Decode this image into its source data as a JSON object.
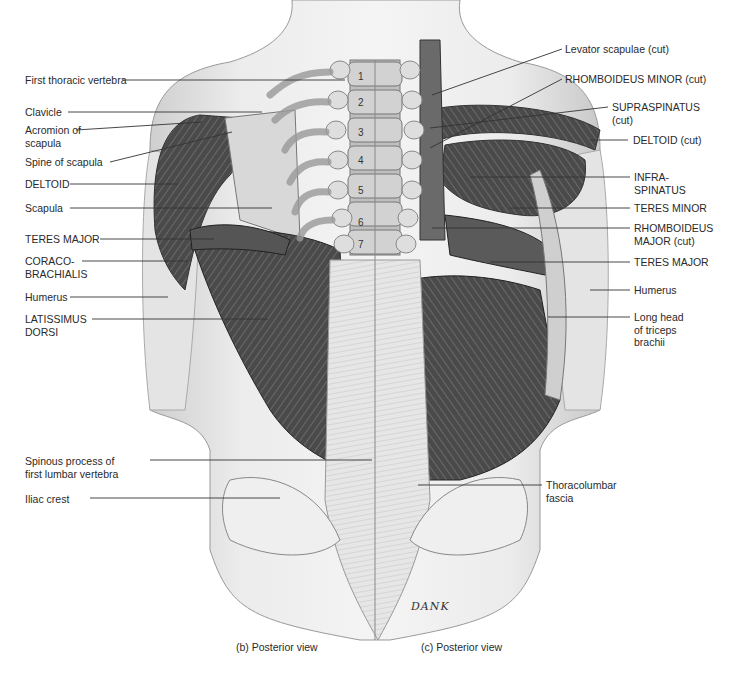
{
  "figure": {
    "left_labels": [
      {
        "id": "first-thoracic-vertebra",
        "text": "First thoracic vertebra",
        "x": 25,
        "y": 75,
        "lx": [
          122,
          330
        ],
        "ly": 80
      },
      {
        "id": "clavicle",
        "text": "Clavicle",
        "x": 25,
        "y": 107,
        "lx": [
          68,
          260
        ],
        "ly": 112
      },
      {
        "id": "acromion-of-scapula",
        "text": "Acromion of\nscapula",
        "x": 25,
        "y": 125,
        "lx": [
          76,
          200
        ],
        "ly": 130
      },
      {
        "id": "spine-of-scapula",
        "text": "Spine of scapula",
        "x": 25,
        "y": 157,
        "lx": [
          110,
          230
        ],
        "ly": 162
      },
      {
        "id": "deltoid",
        "text": "DELTOID",
        "x": 25,
        "y": 179,
        "lx": [
          70,
          178
        ],
        "ly": 184
      },
      {
        "id": "scapula",
        "text": "Scapula",
        "x": 25,
        "y": 203,
        "lx": [
          70,
          272
        ],
        "ly": 208
      },
      {
        "id": "teres-major-left",
        "text": "TERES MAJOR",
        "x": 25,
        "y": 234,
        "lx": [
          100,
          212
        ],
        "ly": 239
      },
      {
        "id": "coraco-brachialis",
        "text": "CORACO-\nBRACHIALIS",
        "x": 25,
        "y": 256,
        "lx": [
          82,
          186
        ],
        "ly": 261
      },
      {
        "id": "humerus-left",
        "text": "Humerus",
        "x": 25,
        "y": 292,
        "lx": [
          70,
          168
        ],
        "ly": 297
      },
      {
        "id": "latissimus-dorsi",
        "text": "LATISSIMUS\nDORSI",
        "x": 25,
        "y": 314,
        "lx": [
          92,
          268
        ],
        "ly": 319
      }
    ],
    "right_labels": [
      {
        "id": "levator-scapulae-cut",
        "text": "Levator scapulae (cut)",
        "x": 565,
        "y": 44
      },
      {
        "id": "rhomboideus-minor-cut",
        "text": "RHOMBOIDEUS MINOR (cut)",
        "x": 565,
        "y": 74
      },
      {
        "id": "supraspinatus-cut",
        "text": "SUPRASPINATUS\n(cut)",
        "x": 612,
        "y": 102
      },
      {
        "id": "deltoid-cut",
        "text": "DELTOID (cut)",
        "x": 632,
        "y": 135
      },
      {
        "id": "infraspinatus",
        "text": "INFRA-\nSPINATUS",
        "x": 634,
        "y": 172
      },
      {
        "id": "teres-minor",
        "text": "TERES MINOR",
        "x": 634,
        "y": 203
      },
      {
        "id": "rhomboideus-major-cut",
        "text": "RHOMBOIDEUS\nMAJOR (cut)",
        "x": 634,
        "y": 222
      },
      {
        "id": "teres-major-right",
        "text": "TERES MAJOR",
        "x": 634,
        "y": 257
      },
      {
        "id": "humerus-right",
        "text": "Humerus",
        "x": 634,
        "y": 285
      },
      {
        "id": "long-head-triceps",
        "text": "Long head\nof triceps\nbrachii",
        "x": 634,
        "y": 312
      }
    ],
    "lower_labels": [
      {
        "id": "spinous-process-l1",
        "text": "Spinous process of\nfirst lumbar vertebra",
        "x": 25,
        "y": 456
      },
      {
        "id": "iliac-crest",
        "text": "Iliac crest",
        "x": 25,
        "y": 494
      },
      {
        "id": "thoracolumbar-fascia",
        "text": "Thoracolumbar\nfascia",
        "x": 546,
        "y": 480
      }
    ],
    "vertebra_numbers": [
      "1",
      "2",
      "3",
      "4",
      "5",
      "6",
      "7"
    ],
    "signature": "DANK",
    "captions": {
      "left": "(b) Posterior view",
      "right": "(c) Posterior view"
    }
  }
}
